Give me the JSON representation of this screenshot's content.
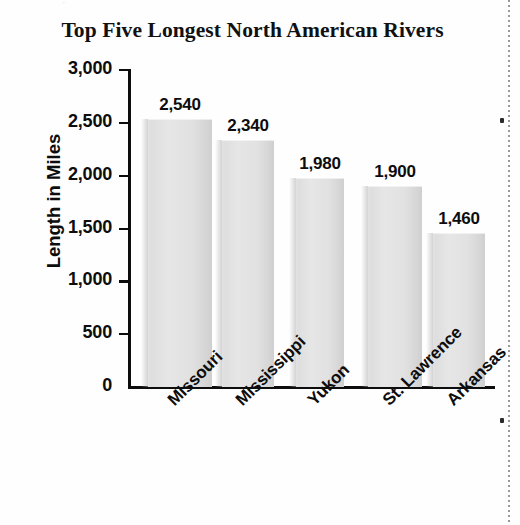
{
  "page": {
    "top_fragment": "·",
    "background_color": "#fefefe"
  },
  "chart_data": {
    "type": "bar",
    "title": "Top Five Longest North American Rivers",
    "xlabel": "",
    "ylabel": "Length in Miles",
    "categories": [
      "Missouri",
      "Mississippi",
      "Yukon",
      "St. Lawrence",
      "Arkansas"
    ],
    "values": [
      2540,
      2340,
      1980,
      1900,
      1460
    ],
    "value_labels": [
      "2,540",
      "2,340",
      "1,980",
      "1,900",
      "1,460"
    ],
    "ylim": [
      0,
      3000
    ],
    "ytick_values": [
      0,
      500,
      1000,
      1500,
      2000,
      2500,
      3000
    ],
    "ytick_labels": [
      "0",
      "500",
      "1,000",
      "1,500",
      "2,000",
      "2,500",
      "3,000"
    ],
    "grid": false,
    "legend": false,
    "bar_color": "#e3e3e3",
    "axis_color": "#0d0d0d",
    "text_color": "#0d0d0d"
  }
}
